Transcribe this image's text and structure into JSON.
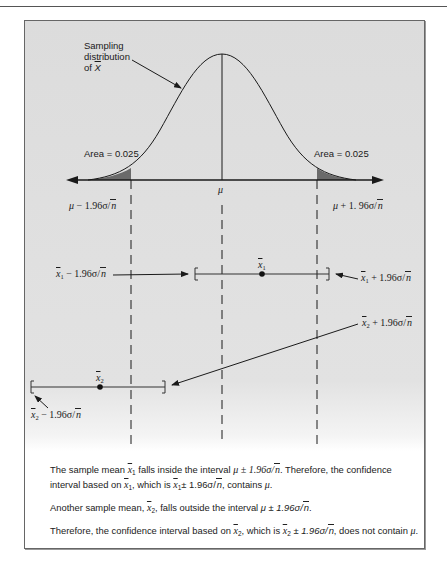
{
  "figure": {
    "curve_label": {
      "line1": "Sampling",
      "line2": "distribution",
      "line3_prefix": "of ",
      "line3_var": "X"
    },
    "area_left": "Area = 0.025",
    "area_right": "Area = 0.025",
    "mu": "μ",
    "lower_crit": {
      "mu": "μ",
      "text": " − 1.96σ/",
      "root": "n"
    },
    "upper_crit": {
      "mu": "μ",
      "text": " + 1. 96σ/",
      "root": "n"
    },
    "interval1": {
      "mean": "x",
      "sub": "1",
      "lower": {
        "x": "x",
        "sub": "1",
        "text": " − 1.96σ/",
        "root": "n"
      },
      "upper": {
        "x": "x",
        "sub": "1",
        "text": " + 1.96σ/",
        "root": "n"
      }
    },
    "interval2": {
      "mean": "x",
      "sub": "2",
      "lower": {
        "x": "x",
        "sub": "2",
        "text": " − 1.96σ/",
        "root": "n"
      },
      "upper": {
        "x": "x",
        "sub": "2",
        "text": " + 1.96σ/",
        "root": "n"
      }
    },
    "colors": {
      "shaded_tail": "#6a6a6a",
      "line": "#1a1a1a",
      "background": "#dedede"
    }
  },
  "caption": {
    "p1": {
      "a": "The sample mean ",
      "x": "x",
      "s": "1",
      "b": " falls inside the interval ",
      "m1": "μ ± 1.96σ/",
      "r1": "n",
      "c": ". Therefore, the confidence interval based on ",
      "x2": "x",
      "s2": "1",
      "d": ", which is ",
      "x3": "x",
      "s3": "1",
      "m2": "± 1.96σ/",
      "r2": "n",
      "e": ", contains ",
      "mu": "μ",
      "f": "."
    },
    "p2": {
      "a": "Another sample mean, ",
      "x": "x",
      "s": "2",
      "b": ", falls outside the interval ",
      "m1": "μ ± 1.96σ/",
      "r1": "n",
      "c": "."
    },
    "p3": {
      "a": "Therefore, the confidence interval based on ",
      "x": "x",
      "s": "2",
      "b": ", which is ",
      "x2": "x",
      "s2": "2",
      "m1": " ± 1.96σ/",
      "r1": "n",
      "c": ", does not contain ",
      "mu": "μ",
      "d": "."
    }
  }
}
